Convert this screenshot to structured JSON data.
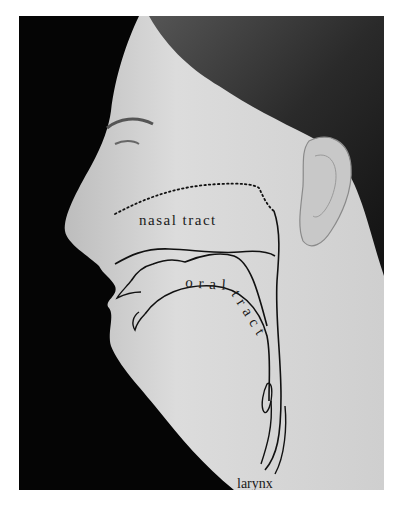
{
  "figure": {
    "labels": {
      "nasal": "nasal tract",
      "oral_1": "o r a l",
      "oral_2": "t r a c t",
      "larynx": "larynx"
    },
    "colors": {
      "background": "#050505",
      "skin": "#d9d9d9",
      "hair": "#3a3a3a",
      "line": "#111111"
    }
  }
}
